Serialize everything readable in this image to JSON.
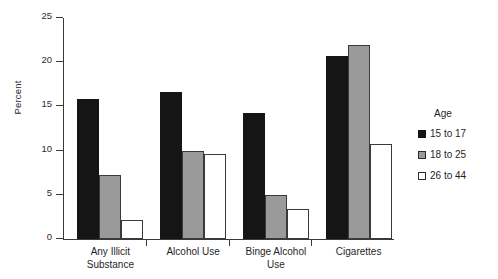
{
  "chart_data": {
    "type": "bar",
    "title": "",
    "xlabel": "",
    "ylabel": "Percent",
    "ylim": [
      0,
      25
    ],
    "yticks": [
      0,
      5,
      10,
      15,
      20,
      25
    ],
    "ytick_labels": [
      "0",
      "5",
      "10",
      "15",
      "20",
      "25"
    ],
    "grid": false,
    "legend_position": "right",
    "legend_title": "Age",
    "categories": [
      "Any Illicit Substance",
      "Alcohol Use",
      "Binge Alcohol Use",
      "Cigarettes"
    ],
    "category_lines": [
      [
        "Any Illicit",
        "Substance"
      ],
      [
        "Alcohol Use"
      ],
      [
        "Binge Alcohol",
        "Use"
      ],
      [
        "Cigarettes"
      ]
    ],
    "series": [
      {
        "name": "15 to 17",
        "color": "#151515",
        "values": [
          15.8,
          16.6,
          14.3,
          20.7
        ]
      },
      {
        "name": "18 to 25",
        "color": "#9a9a9a",
        "values": [
          7.2,
          10.0,
          5.0,
          22.0
        ]
      },
      {
        "name": "26 to 44",
        "color": "#ffffff",
        "values": [
          2.1,
          9.6,
          3.4,
          10.8
        ]
      }
    ]
  }
}
